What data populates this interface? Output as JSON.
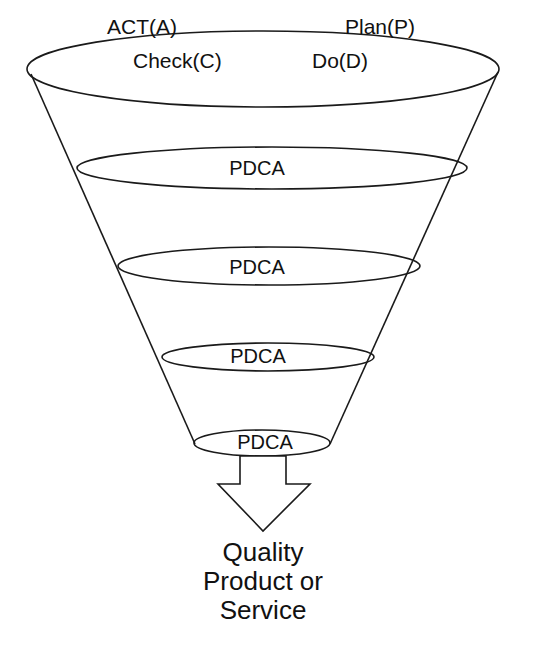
{
  "diagram": {
    "type": "funnel",
    "stroke_color": "#1a1a1a",
    "top_ring": {
      "labels": {
        "act": "ACT(A)",
        "plan": "Plan(P)",
        "check": "Check(C)",
        "do": "Do(D)"
      }
    },
    "rings": [
      {
        "label": "PDCA"
      },
      {
        "label": "PDCA"
      },
      {
        "label": "PDCA"
      },
      {
        "label": "PDCA"
      }
    ],
    "output": {
      "line1": "Quality",
      "line2": "Product or",
      "line3": "Service"
    }
  }
}
